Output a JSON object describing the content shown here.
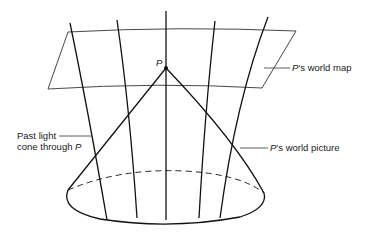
{
  "diagram": {
    "type": "spacetime light-cone diagram",
    "event_label": "P",
    "labels": {
      "world_map": {
        "prefix": "P",
        "suffix": "’s world map"
      },
      "world_picture": {
        "prefix": "P",
        "suffix": "’s world picture"
      },
      "light_cone": {
        "line1": "Past light",
        "line2_text": "cone through ",
        "line2_var": "P"
      }
    },
    "colors": {
      "stroke": "#111111",
      "thin_stroke": "#333333",
      "background": "#ffffff"
    }
  }
}
